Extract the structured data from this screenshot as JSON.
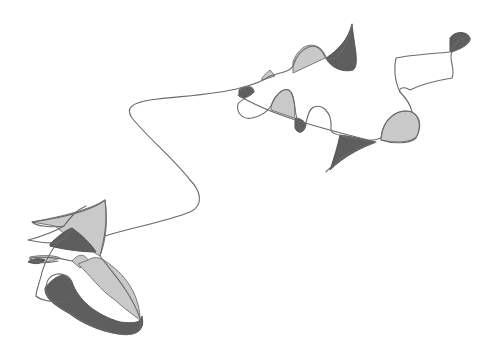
{
  "artwork": {
    "description": "Abstract continuous-line pencil drawing with light and dark grey shaded regions",
    "colors": {
      "background": "#ffffff",
      "line": "#6a6a6a",
      "light_fill": "#c9c9c9",
      "mid_fill": "#b3b3b3",
      "dark_fill": "#5e5e5e"
    },
    "light_shapes": [
      "M293,62 C300,42 318,40 325,55 C328,62 326,58 325,58 L293,73 Z",
      "M262,78 C265,74 268,72 270,70 L275,76 L262,80 Z",
      "M271,106 C276,92 287,84 292,94 C296,104 295,115 294,118 L271,110 Z",
      "M381,138 C383,118 398,108 412,112 C420,117 421,128 417,136 C411,143 395,143 381,140 Z",
      "M32,222 C55,218 90,210 105,200 C108,222 106,240 100,256 L70,238 L55,226 Z",
      "M72,261 C80,252 85,255 88,260 L80,268 Z",
      "M78,264 C90,275 100,290 115,300 C128,312 138,318 140,320 C140,300 130,280 112,266 C102,258 96,255 88,260 Z",
      "M30,257 C40,255 55,255 60,258 C50,262 40,264 30,261 Z"
    ],
    "dark_shapes": [
      "M326,58 C338,50 348,40 352,24 C354,45 360,65 353,70 C342,73 330,67 326,58 Z",
      "M239,90 C244,86 253,86 254,92 C250,97 242,99 239,96 Z",
      "M295,118 C300,118 304,121 306,124 C305,133 298,135 295,128 Z",
      "M340,135 C350,136 365,140 375,142 C362,148 345,155 330,170 C334,158 338,145 340,135 Z",
      "M450,38 C455,30 470,31 470,40 C467,47 455,50 450,52 Z",
      "M50,244 C58,236 66,230 72,228 C82,235 92,245 96,252 C84,252 66,250 50,246 Z",
      "M28,262 C34,258 40,258 45,260 C40,265 34,264 28,262 Z",
      "M45,288 C55,275 67,270 72,282 C78,300 96,315 120,322 C135,324 142,322 142,316 C145,330 138,336 120,334 C100,332 80,322 70,314 C60,308 44,300 45,288 Z"
    ],
    "strokes": [
      "M190,180 C175,160 150,140 132,118 C125,108 132,103 150,100 C180,96 215,95 240,88 C252,85 262,82 270,76 C282,72 290,72 293,66 C300,45 318,40 324,55 C330,66 345,56 352,24",
      "M240,92 C248,84 253,86 254,92 C247,98 240,100 238,104 C236,112 242,120 252,118 C262,116 267,112 271,106 C276,92 288,84 292,94 C296,104 294,118 301,130 C307,134 305,110 314,107 C322,104 332,112 331,127 C330,135 338,134 350,138 C362,140 372,142 381,138 C383,118 398,108 412,112 C422,118 421,128 416,138 C410,144 392,144 381,140",
      "M238,95 C270,115 320,128 376,142 C368,146 350,150 340,160 C333,166 327,170 326,172",
      "M412,112 C410,102 404,96 400,92 C398,88 404,86 410,90 C422,84 440,80 452,78 C456,70 448,58 452,52",
      "M400,92 C394,80 394,66 396,58 C410,55 430,54 450,52 C455,44 460,36 470,38 C470,44 462,48 452,52",
      "M190,180 C200,190 205,205 190,212 C165,222 130,228 105,236",
      "M105,200 C108,222 104,240 100,256 C110,270 130,290 140,318 C144,335 130,336 118,334 C96,330 80,320 68,312 C58,306 44,300 46,286 C48,274 62,268 72,282",
      "M105,200 C90,212 60,218 32,222 C36,226 52,228 64,226 C70,218 76,210 86,206",
      "M64,226 C50,234 36,238 28,240 C38,242 52,244 58,242 C66,238 70,232 72,228",
      "M72,261 C60,258 42,256 30,258 C32,263 45,264 58,261",
      "M58,242 C50,252 45,262 42,272 C40,282 36,290 36,296 C40,300 52,302 65,302"
    ]
  }
}
